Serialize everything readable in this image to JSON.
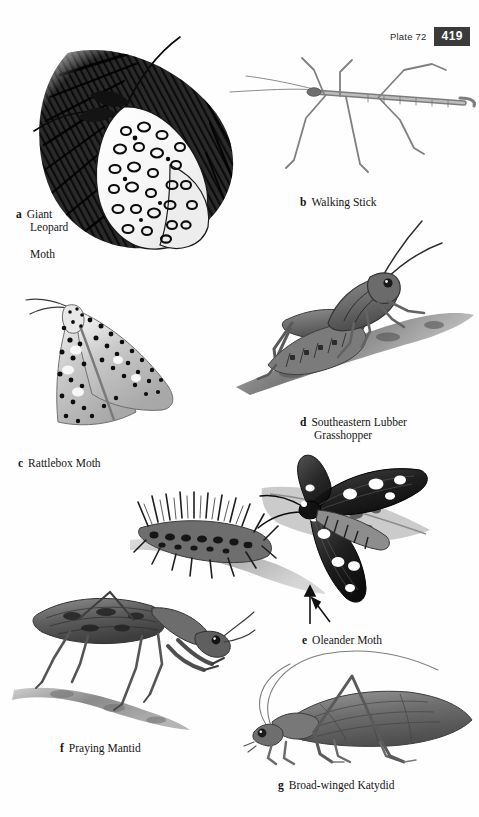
{
  "header": {
    "plate_label": "Plate 72",
    "page_number": "419"
  },
  "plate": {
    "figures": [
      {
        "letter": "a",
        "name": "Giant Leopard Moth",
        "caption_lines": [
          "Giant",
          "Leopard",
          "Moth"
        ],
        "icon": "giant-leopard-moth-illustration"
      },
      {
        "letter": "b",
        "name": "Walking Stick",
        "caption_lines": [
          "Walking Stick"
        ],
        "icon": "walking-stick-illustration"
      },
      {
        "letter": "c",
        "name": "Rattlebox Moth",
        "caption_lines": [
          "Rattlebox Moth"
        ],
        "icon": "rattlebox-moth-illustration"
      },
      {
        "letter": "d",
        "name": "Southeastern Lubber Grasshopper",
        "caption_lines": [
          "Southeastern Lubber",
          "Grasshopper"
        ],
        "icon": "lubber-grasshopper-illustration"
      },
      {
        "letter": "e",
        "name": "Oleander Moth",
        "caption_lines": [
          "Oleander Moth"
        ],
        "icon": "oleander-moth-illustration"
      },
      {
        "letter": "f",
        "name": "Praying Mantid",
        "caption_lines": [
          "Praying Mantid"
        ],
        "icon": "praying-mantid-illustration"
      },
      {
        "letter": "g",
        "name": "Broad-winged Katydid",
        "caption_lines": [
          "Broad-winged Katydid"
        ],
        "icon": "broad-winged-katydid-illustration"
      }
    ]
  },
  "colors": {
    "ink": "#141414",
    "page_bg": "#fefefe",
    "page_number_bg": "#3a3a3a",
    "page_number_fg": "#ffffff",
    "wash_gray": "#8d8d8d",
    "dark_gray": "#4a4a4a"
  }
}
